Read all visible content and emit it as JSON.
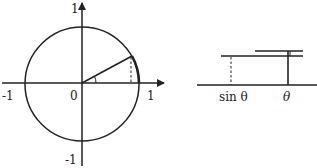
{
  "left_diagram": {
    "type": "unit-circle",
    "axis_labels": {
      "x_pos": "1",
      "x_neg": "-1",
      "y_pos": "1",
      "y_neg": "-1",
      "origin": "0"
    }
  },
  "right_diagram": {
    "type": "segment-comparison",
    "labels": {
      "sin": "sin θ",
      "theta": "θ"
    }
  },
  "colors": {
    "stroke": "#222222",
    "background": "#ffffff"
  }
}
